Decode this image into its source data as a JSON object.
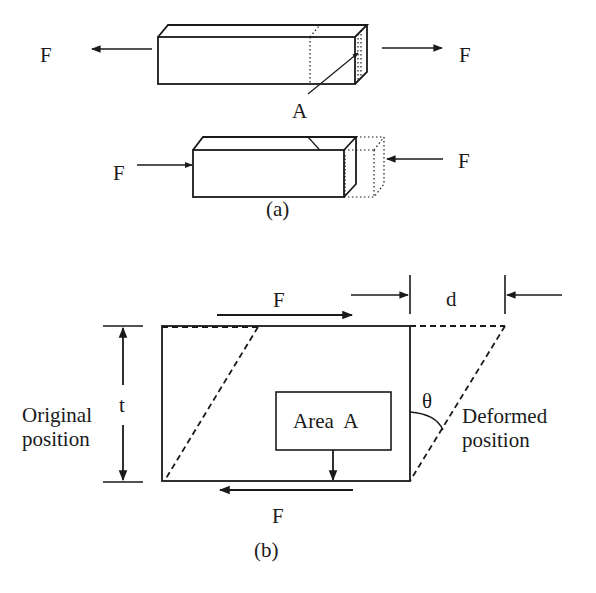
{
  "figure_a": {
    "caption": "(a)",
    "tension": {
      "left_force_label": "F",
      "right_force_label": "F"
    },
    "area_label": "A",
    "compression": {
      "left_force_label": "F",
      "right_force_label": "F"
    }
  },
  "figure_b": {
    "caption": "(b)",
    "top_force_label": "F",
    "bottom_force_label": "F",
    "displacement_label": "d",
    "thickness_label": "t",
    "angle_label": "θ",
    "area_box_label": "Area  A",
    "original_label": [
      "Original",
      "position"
    ],
    "deformed_label": [
      "Deformed",
      "position"
    ]
  },
  "colors": {
    "ink": "#1a1a1a",
    "background": "#ffffff"
  }
}
